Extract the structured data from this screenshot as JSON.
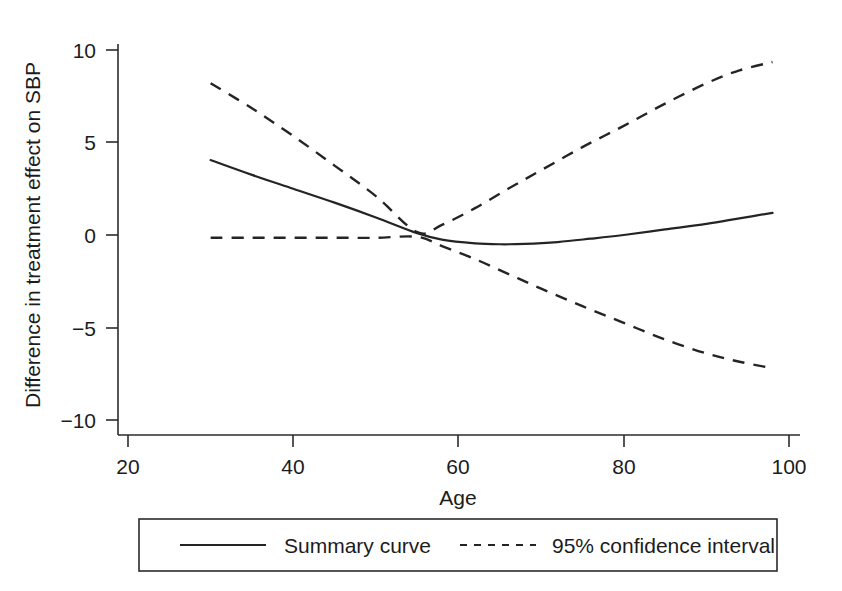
{
  "chart_data": {
    "type": "line",
    "title": "",
    "xlabel": "Age",
    "ylabel": "Difference in treatment effect on SBP",
    "xlim": [
      20,
      100
    ],
    "ylim": [
      -10,
      10
    ],
    "xticks": [
      20,
      40,
      60,
      80,
      100
    ],
    "yticks": [
      10,
      5,
      0,
      -5,
      -10
    ],
    "xticklabels": [
      "20",
      "40",
      "60",
      "80",
      "100"
    ],
    "yticklabels": [
      "10",
      "5",
      "0",
      "-5",
      "-10"
    ],
    "grid": false,
    "legend_position": "bottom-center",
    "series": [
      {
        "name": "Summary curve",
        "style": "solid",
        "x": [
          30,
          35,
          40,
          45,
          50,
          55,
          58,
          62,
          65,
          68,
          72,
          76,
          80,
          85,
          90,
          94,
          98
        ],
        "values": [
          4.05,
          3.25,
          2.5,
          1.75,
          0.95,
          0.1,
          -0.25,
          -0.45,
          -0.5,
          -0.48,
          -0.38,
          -0.2,
          0.0,
          0.3,
          0.6,
          0.9,
          1.2
        ]
      },
      {
        "name": "95% confidence interval upper",
        "style": "dashed",
        "x": [
          30,
          35,
          40,
          45,
          50,
          55,
          58,
          62,
          66,
          70,
          75,
          80,
          85,
          90,
          94,
          98
        ],
        "values": [
          8.2,
          6.85,
          5.35,
          3.75,
          2.1,
          0.15,
          0.55,
          1.45,
          2.5,
          3.5,
          4.75,
          5.9,
          7.1,
          8.2,
          8.9,
          9.35
        ]
      },
      {
        "name": "95% confidence interval lower",
        "style": "dashed",
        "x": [
          30,
          35,
          40,
          45,
          50,
          55,
          58,
          62,
          66,
          70,
          75,
          80,
          85,
          90,
          94,
          98
        ],
        "values": [
          -0.15,
          -0.15,
          -0.15,
          -0.15,
          -0.15,
          -0.1,
          -0.6,
          -1.3,
          -2.1,
          -2.9,
          -3.85,
          -4.75,
          -5.65,
          -6.4,
          -6.85,
          -7.2
        ]
      }
    ]
  },
  "axes": {
    "y_title": "Difference in treatment effect on SBP",
    "x_title": "Age",
    "y_tick_labels": [
      "10",
      "5",
      "0",
      "−5",
      "−10"
    ],
    "x_tick_labels": [
      "20",
      "40",
      "60",
      "80",
      "100"
    ]
  },
  "legend": {
    "items": [
      {
        "label": "Summary curve",
        "style": "solid"
      },
      {
        "label": "95% confidence interval",
        "style": "dashed"
      }
    ]
  },
  "colors": {
    "line": "#242424",
    "axis": "#2b2b2b",
    "background": "#ffffff"
  }
}
